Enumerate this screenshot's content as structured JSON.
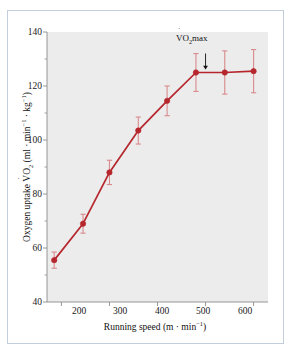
{
  "figure": {
    "background_color": "#ffffff",
    "frame_border_color": "#c3cedd",
    "plot_background_color": "#ececec"
  },
  "chart_data": {
    "type": "line",
    "title": "",
    "subtitle": "",
    "xlabel": "Running speed (m · min⁻¹)",
    "ylabel": "Oxygen uptake V̇O₂ (ml · min⁻¹ · kg⁻¹)",
    "xlim": [
      170,
      630
    ],
    "ylim": [
      40,
      140
    ],
    "xticks": [
      200,
      300,
      400,
      500,
      600
    ],
    "yticks": [
      40,
      60,
      80,
      100,
      120,
      140
    ],
    "yminorticks": [
      50,
      70,
      90,
      110,
      130
    ],
    "grid": false,
    "legend": null,
    "legend_position": "none",
    "series": [
      {
        "name": "Oxygen uptake",
        "color": "#b5272d",
        "marker": "circle",
        "x": [
          185,
          245,
          300,
          360,
          420,
          480,
          540,
          600
        ],
        "values": [
          55.5,
          69.0,
          88.0,
          103.5,
          114.5,
          125.0,
          125.0,
          125.5
        ],
        "yerr": [
          3.0,
          3.5,
          4.5,
          5.0,
          5.5,
          7.0,
          8.0,
          8.0
        ]
      }
    ],
    "annotations": [
      {
        "text": "V̇O₂max",
        "x": 500,
        "y": 125,
        "arrow": "down"
      }
    ]
  },
  "axis": {
    "x_tick_labels": [
      "200",
      "300",
      "400",
      "500",
      "600"
    ],
    "y_tick_labels": [
      "40",
      "60",
      "80",
      "100",
      "120",
      "140"
    ],
    "x_title": "Running speed (m · min⁻¹)",
    "y_title": "Oxygen uptake V̇O₂ (ml · min⁻¹ · kg⁻¹)"
  },
  "annotation": {
    "vo2max_label": "V̇O₂max"
  }
}
